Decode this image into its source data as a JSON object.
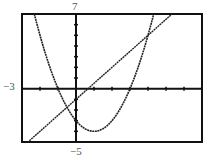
{
  "chart_data": {
    "type": "line",
    "title": "",
    "xlabel": "",
    "ylabel": "",
    "xlim": [
      -3,
      7
    ],
    "ylim": [
      -5,
      7
    ],
    "grid": false,
    "x_tick_step": 1,
    "y_tick_step": 1,
    "series": [
      {
        "name": "parabola",
        "expression": "y = x^2 - 2x - 3",
        "x": [
          -3,
          -2,
          -1,
          0,
          1,
          2,
          3,
          4,
          5
        ],
        "values": [
          12,
          5,
          0,
          -3,
          -4,
          -3,
          0,
          5,
          12
        ]
      },
      {
        "name": "line",
        "expression": "y = 1.5x - 1",
        "x": [
          -3,
          0,
          4,
          7
        ],
        "values": [
          -5.5,
          -1,
          5,
          9.5
        ]
      }
    ],
    "annotations": {
      "ymax_label": "7",
      "ymin_label": "−5",
      "xmin_label": "−3"
    }
  },
  "labels": {
    "ymax": "7",
    "ymin": "−5",
    "xmin": "−3"
  }
}
